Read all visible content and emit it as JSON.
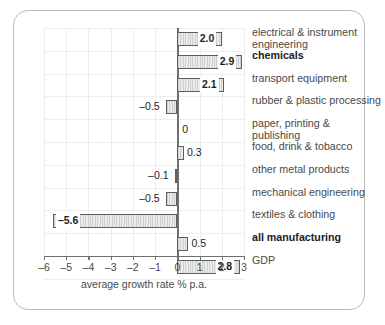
{
  "chart_data": {
    "type": "bar",
    "orientation": "horizontal",
    "title": "",
    "xlabel": "average growth rate % p.a.",
    "ylabel": "",
    "xlim": [
      -6,
      3
    ],
    "xticks": [
      -6,
      -5,
      -4,
      -3,
      -2,
      -1,
      0,
      1,
      2,
      3
    ],
    "xticklabels": [
      "–6",
      "–5",
      "–4",
      "–3",
      "–2",
      "–1",
      "0",
      "1",
      "2",
      "3"
    ],
    "grid": true,
    "legend": false,
    "categories": [
      "electrical & instrument\nengineering",
      "chemicals",
      "transport equipment",
      "rubber & plastic processing",
      "paper, printing &\npublishing",
      "food, drink & tobacco",
      "other metal products",
      "mechanical engineering",
      "textiles & clothing",
      "all manufacturing",
      "GDP"
    ],
    "values": [
      2.0,
      2.9,
      2.1,
      -0.5,
      0,
      0.3,
      -0.1,
      -0.5,
      -5.6,
      0.5,
      2.8
    ],
    "value_labels": [
      "2.0",
      "2.9",
      "2.1",
      "–0.5",
      "0",
      "0.3",
      "–0.1",
      "–0.5",
      "–5.6",
      "0.5",
      "2.8"
    ],
    "bold_categories": [
      "chemicals",
      "all manufacturing"
    ],
    "colors": {
      "bar_fill": "#dcdcdc",
      "bar_edge": "#5e5e5e",
      "grid": "#ededed",
      "axis": "#6f6f6f",
      "frame": "#b9b9b9",
      "text": "#4a4a4a"
    }
  }
}
